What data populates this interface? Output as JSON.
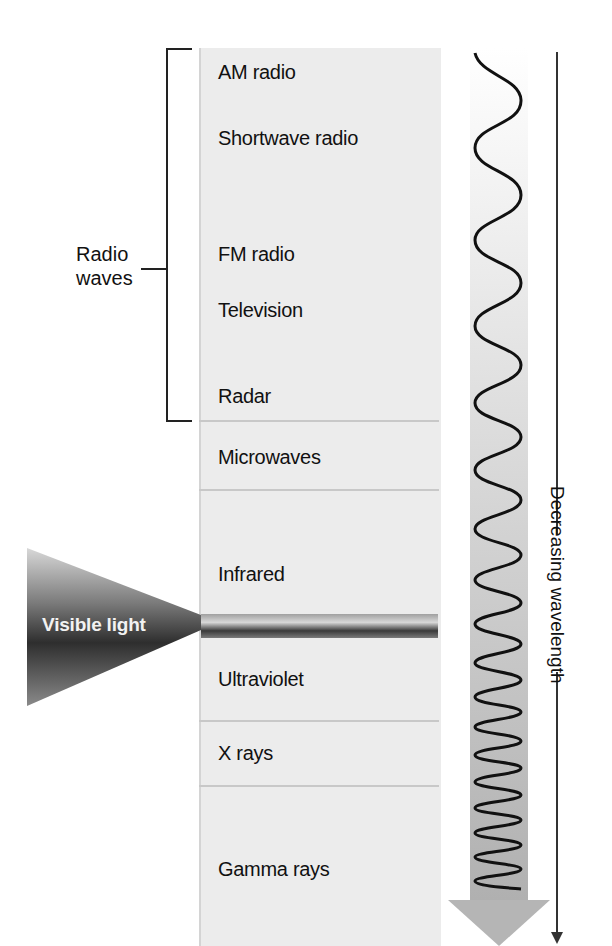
{
  "diagram": {
    "bands": [
      {
        "label": "AM radio",
        "top": 60
      },
      {
        "label": "Shortwave radio",
        "top": 126
      },
      {
        "label": "FM radio",
        "top": 242
      },
      {
        "label": "Television",
        "top": 298
      },
      {
        "label": "Radar",
        "top": 384
      },
      {
        "label": "Microwaves",
        "top": 445
      },
      {
        "label": "Infrared",
        "top": 562
      },
      {
        "label": "Ultraviolet",
        "top": 667
      },
      {
        "label": "X rays",
        "top": 741
      },
      {
        "label": "Gamma rays",
        "top": 857
      }
    ],
    "group_label": "Radio\nwaves",
    "group_label_line1": "Radio",
    "group_label_line2": "waves",
    "visible_light_label": "Visible light",
    "axis_label": "Decreasing wavelength",
    "colors": {
      "column_bg": "#ececec",
      "divider": "#c8c8c8",
      "arrow_fill": "#b8b8b8",
      "wave_stroke": "#111111",
      "cone_dark": "#3a3a3a",
      "cone_light": "#bdbdbd"
    }
  }
}
